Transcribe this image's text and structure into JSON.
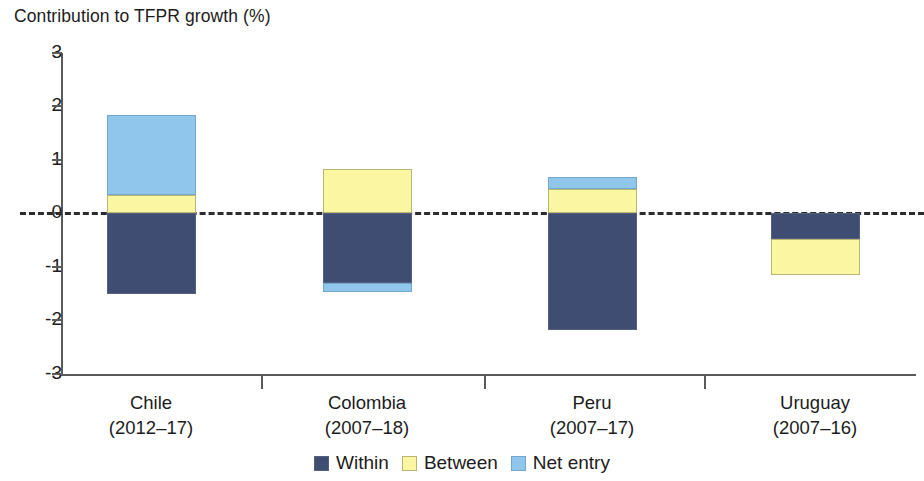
{
  "chart_data": {
    "type": "bar",
    "title": "Contribution to TFPR growth (%)",
    "subtitle": "",
    "xlabel": "",
    "ylabel": "Contribution to TFPR growth (%)",
    "ylim": [
      -3,
      3
    ],
    "yticks": [
      "3",
      "2",
      "1",
      "0",
      "-1",
      "-2",
      "-3"
    ],
    "ytick_values": [
      3,
      2,
      1,
      0,
      -1,
      -2,
      -3
    ],
    "grid": false,
    "stacked": true,
    "zero_line": "dashed",
    "legend_position": "bottom-center",
    "categories": [
      "Chile",
      "Colombia",
      "Peru",
      "Uruguay"
    ],
    "category_periods": [
      "(2012–17)",
      "(2007–18)",
      "(2007–17)",
      "(2007–16)"
    ],
    "series": [
      {
        "name": "Within",
        "color": "#3f4d72",
        "values": [
          -1.52,
          -1.3,
          -2.18,
          -0.48
        ]
      },
      {
        "name": "Between",
        "color": "#faf6a2",
        "values": [
          0.33,
          0.83,
          0.44,
          -0.68
        ]
      },
      {
        "name": "Net entry",
        "color": "#90c6ec",
        "values": [
          1.5,
          -0.17,
          0.24,
          0.0
        ]
      }
    ],
    "annotations": []
  },
  "bars": [
    {
      "name": "Chile",
      "period": "(2012–17)",
      "segments": [
        {
          "series": "Net entry",
          "from": 0.33,
          "to": 1.83
        },
        {
          "series": "Between",
          "from": 0.0,
          "to": 0.33
        },
        {
          "series": "Within",
          "from": 0.0,
          "to": -1.52
        }
      ]
    },
    {
      "name": "Colombia",
      "period": "(2007–18)",
      "segments": [
        {
          "series": "Between",
          "from": 0.0,
          "to": 0.83
        },
        {
          "series": "Within",
          "from": 0.0,
          "to": -1.3
        },
        {
          "series": "Net entry",
          "from": -1.3,
          "to": -1.47
        }
      ]
    },
    {
      "name": "Peru",
      "period": "(2007–17)",
      "segments": [
        {
          "series": "Net entry",
          "from": 0.44,
          "to": 0.68
        },
        {
          "series": "Between",
          "from": 0.0,
          "to": 0.44
        },
        {
          "series": "Within",
          "from": 0.0,
          "to": -2.18
        }
      ]
    },
    {
      "name": "Uruguay",
      "period": "(2007–16)",
      "segments": [
        {
          "series": "Within",
          "from": 0.0,
          "to": -0.48
        },
        {
          "series": "Between",
          "from": -0.48,
          "to": -1.16
        }
      ]
    }
  ],
  "legend": {
    "items": [
      {
        "label": "Within",
        "color": "#3f4d72"
      },
      {
        "label": "Between",
        "color": "#faf6a2"
      },
      {
        "label": "Net entry",
        "color": "#90c6ec"
      }
    ]
  }
}
